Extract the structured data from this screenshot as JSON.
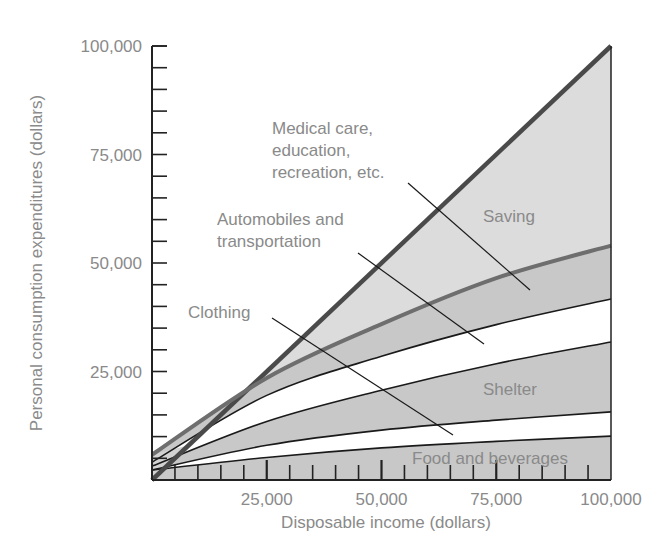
{
  "chart_data": {
    "type": "area",
    "title": "",
    "xlabel": "Disposable income (dollars)",
    "ylabel": "Personal consumption expenditures (dollars)",
    "xlim": [
      0,
      100000
    ],
    "ylim": [
      0,
      100000
    ],
    "x_ticks": [
      25000,
      50000,
      75000,
      100000
    ],
    "x_tick_labels": [
      "25,000",
      "50,000",
      "75,000",
      "100,000"
    ],
    "y_ticks": [
      25000,
      50000,
      75000,
      100000
    ],
    "y_tick_labels": [
      "25,000",
      "50,000",
      "75,000",
      "100,000"
    ],
    "minor_tick_step": 5000,
    "grid": false,
    "legend": "none (inline annotations)",
    "x": [
      0,
      25000,
      50000,
      75000,
      100000
    ],
    "reference_line": {
      "name": "45-degree line (income = consumption)",
      "values": [
        0,
        25000,
        50000,
        75000,
        100000
      ]
    },
    "series": [
      {
        "name": "Food and beverages",
        "upper_boundary": [
          2300,
          5200,
          7400,
          8900,
          10100
        ]
      },
      {
        "name": "Shelter",
        "upper_boundary": [
          2300,
          8000,
          11500,
          13800,
          15700
        ]
      },
      {
        "name": "Clothing",
        "upper_boundary": [
          3200,
          13500,
          20700,
          26800,
          31800
        ]
      },
      {
        "name": "Automobiles and transportation",
        "upper_boundary": [
          4100,
          19500,
          28500,
          35800,
          41700
        ]
      },
      {
        "name": "Medical care, education, recreation, etc.",
        "upper_boundary": [
          5800,
          23500,
          35900,
          46500,
          54000
        ]
      },
      {
        "name": "Saving",
        "upper_boundary": [
          0,
          25000,
          50000,
          75000,
          100000
        ],
        "note": "area between consumption curve and 45-degree line"
      }
    ],
    "band_fills": [
      "#c8c8c8",
      "#ffffff",
      "#c8c8c8",
      "#ffffff",
      "#c8c8c8",
      "#dcdcdc"
    ],
    "annotations": [
      {
        "text": [
          "Medical care,",
          "education,",
          "recreation, etc."
        ],
        "x": 272,
        "y": 134,
        "leader": [
          408,
          183,
          530,
          290
        ]
      },
      {
        "text": [
          "Automobiles and",
          "transportation"
        ],
        "x": 217,
        "y": 225,
        "leader": [
          358,
          253,
          484,
          344
        ]
      },
      {
        "text": [
          "Clothing"
        ],
        "x": 188,
        "y": 318,
        "leader": [
          272,
          318,
          453,
          435
        ]
      },
      {
        "text": [
          "Saving"
        ],
        "x": 483,
        "y": 222,
        "leader": null
      },
      {
        "text": [
          "Shelter"
        ],
        "x": 483,
        "y": 395,
        "leader": null
      },
      {
        "text": [
          "Food and beverages"
        ],
        "x": 412,
        "y": 464,
        "leader": null
      }
    ],
    "colors": {
      "axis": "#222222",
      "band_line": "#1a1a1a",
      "consumption_line": "#6e6e6e",
      "reference_line": "#4a4a4a",
      "text": "#8a8a8a"
    }
  }
}
